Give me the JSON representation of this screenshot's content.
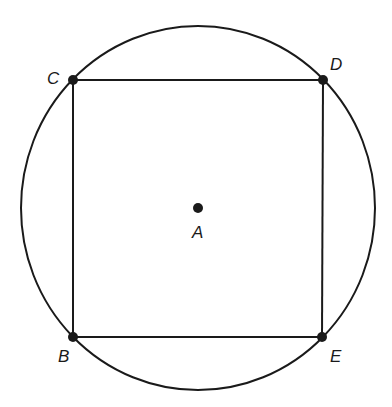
{
  "diagram": {
    "type": "geometry",
    "stroke_color": "#1a1a1a",
    "background": "#ffffff",
    "circle": {
      "center": "A",
      "cx": 198,
      "cy": 208,
      "rx": 177,
      "ry": 182
    },
    "points": [
      {
        "id": "A",
        "label": "A",
        "x": 198,
        "y": 208,
        "label_x": 192,
        "label_y": 238
      },
      {
        "id": "B",
        "label": "B",
        "x": 73,
        "y": 337,
        "label_x": 58,
        "label_y": 362
      },
      {
        "id": "C",
        "label": "C",
        "x": 73,
        "y": 80,
        "label_x": 47,
        "label_y": 84
      },
      {
        "id": "D",
        "label": "D",
        "x": 323,
        "y": 80,
        "label_x": 330,
        "label_y": 70
      },
      {
        "id": "E",
        "label": "E",
        "x": 322,
        "y": 337,
        "label_x": 330,
        "label_y": 362
      }
    ],
    "segments": [
      {
        "from": "C",
        "to": "D"
      },
      {
        "from": "D",
        "to": "E"
      },
      {
        "from": "E",
        "to": "B"
      },
      {
        "from": "B",
        "to": "C"
      }
    ]
  }
}
